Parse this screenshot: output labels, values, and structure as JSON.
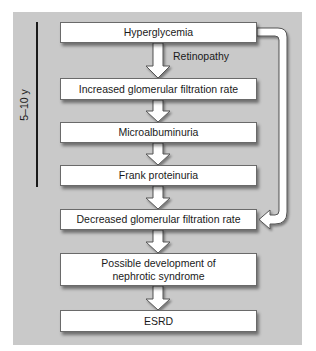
{
  "diagram": {
    "type": "flowchart",
    "background_color": "#c9c9c9",
    "timeline": {
      "label": "5–10 y"
    },
    "annotation": "Retinopathy",
    "nodes": [
      {
        "id": "hyperglycemia",
        "label": "Hyperglycemia"
      },
      {
        "id": "increased-gfr",
        "label": "Increased glomerular filtration rate"
      },
      {
        "id": "microalbuminuria",
        "label": "Microalbuminuria"
      },
      {
        "id": "frank-proteinuria",
        "label": "Frank proteinuria"
      },
      {
        "id": "decreased-gfr",
        "label": "Decreased glomerular filtration rate"
      },
      {
        "id": "nephrotic-syndrome",
        "label_line1": "Possible development of",
        "label_line2": "nephrotic syndrome"
      },
      {
        "id": "esrd",
        "label": "ESRD"
      }
    ],
    "edges": [
      {
        "from": "hyperglycemia",
        "to": "increased-gfr"
      },
      {
        "from": "increased-gfr",
        "to": "microalbuminuria"
      },
      {
        "from": "microalbuminuria",
        "to": "frank-proteinuria"
      },
      {
        "from": "frank-proteinuria",
        "to": "decreased-gfr"
      },
      {
        "from": "decreased-gfr",
        "to": "nephrotic-syndrome"
      },
      {
        "from": "nephrotic-syndrome",
        "to": "esrd"
      },
      {
        "from": "hyperglycemia",
        "to": "decreased-gfr",
        "route": "right-side bypass"
      }
    ]
  }
}
